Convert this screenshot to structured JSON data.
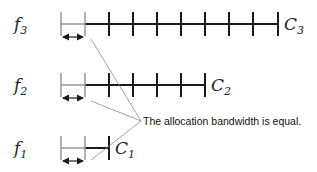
{
  "diagram": {
    "rows": [
      {
        "id": "f3",
        "label": "f",
        "label_sub": "3",
        "channel": "C",
        "channel_sub": "3",
        "line_y": 24,
        "tick_top": 12,
        "tick_bottom": 36,
        "ticks": [
          85,
          109,
          133,
          157,
          181,
          205,
          229,
          253,
          278
        ]
      },
      {
        "id": "f2",
        "label": "f",
        "label_sub": "2",
        "channel": "C",
        "channel_sub": "2",
        "line_y": 85,
        "tick_top": 73,
        "tick_bottom": 97,
        "ticks": [
          85,
          109,
          133,
          157,
          181,
          205
        ]
      },
      {
        "id": "f1",
        "label": "f",
        "label_sub": "1",
        "channel": "C",
        "channel_sub": "1",
        "line_y": 148,
        "tick_top": 136,
        "tick_bottom": 160,
        "ticks": [
          85,
          109
        ]
      }
    ],
    "annotation": "The allocation bandwidth is equal.",
    "colors": {
      "line": "#1a1a1a",
      "light": "#999999",
      "pointer": "#888888"
    }
  }
}
